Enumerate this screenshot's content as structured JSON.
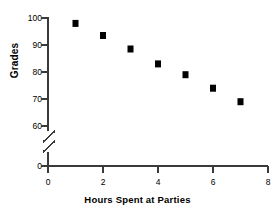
{
  "chart_data": {
    "type": "scatter",
    "title": "",
    "xlabel": "Hours Spent at Parties",
    "ylabel": "Grades",
    "x": [
      1,
      2,
      3,
      4,
      5,
      6,
      7
    ],
    "values": [
      98,
      93.5,
      88.5,
      83,
      79,
      74,
      69
    ],
    "points": [
      {
        "x": 1,
        "y": 98
      },
      {
        "x": 2,
        "y": 93.5
      },
      {
        "x": 3,
        "y": 88.5
      },
      {
        "x": 4,
        "y": 83
      },
      {
        "x": 5,
        "y": 79
      },
      {
        "x": 6,
        "y": 74
      },
      {
        "x": 7,
        "y": 69
      }
    ],
    "xlim": [
      0,
      8
    ],
    "ylim": [
      60,
      100
    ],
    "xticks": [
      0,
      2,
      4,
      6,
      8
    ],
    "xtick_labels": [
      "0",
      "2",
      "4",
      "6",
      "8"
    ],
    "yticks": [
      0,
      60,
      70,
      80,
      90,
      100
    ],
    "ytick_labels": [
      "0",
      "60",
      "70",
      "80",
      "90",
      "100"
    ],
    "grid": false,
    "legend": null,
    "axis_break": {
      "axis": "y",
      "between": [
        0,
        60
      ],
      "symbol": "double-slash"
    },
    "marker": "square",
    "marker_color": "#000000",
    "axis_color": "#3a3a3a"
  },
  "axis": {
    "y_label_text": "Grades",
    "x_label_text": "Hours Spent at Parties"
  }
}
